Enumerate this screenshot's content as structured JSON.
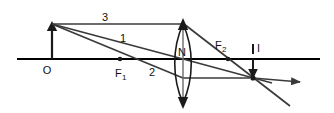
{
  "diagram": {
    "colors": {
      "background": "#ffffff",
      "ink": "#1a1a1a",
      "ray": "#3a3a3a",
      "axis": "#000000"
    },
    "labels": {
      "object": "O",
      "focal_near": "F",
      "focal_near_sub": "1",
      "focal_far": "F",
      "focal_far_sub": "2",
      "lens_center": "N",
      "image": "I",
      "ray_one": "1",
      "ray_two": "2",
      "ray_three": "3"
    },
    "geometry": {
      "axis_y": 59,
      "axis_x_start": 17,
      "axis_x_end": 320,
      "object_x": 52,
      "object_top_y": 24,
      "lens_x": 183,
      "lens_top_y": 22,
      "lens_bottom_y": 105,
      "focal_near_x": 120,
      "focal_far_x": 228,
      "image_x": 253,
      "image_bottom_y": 78
    },
    "points": [
      {
        "name": "object-base",
        "x": 52,
        "y": 59
      },
      {
        "name": "object-tip",
        "x": 52,
        "y": 24
      },
      {
        "name": "focal-point-1",
        "x": 120,
        "y": 59
      },
      {
        "name": "lens-center-N",
        "x": 183,
        "y": 59
      },
      {
        "name": "focal-point-2",
        "x": 228,
        "y": 59
      },
      {
        "name": "image-point",
        "x": 253,
        "y": 78
      }
    ],
    "rays": [
      {
        "id": "3",
        "description": "parallel-to-axis-then-through-F2",
        "path": "52,24 183,24 253,78"
      },
      {
        "id": "1",
        "description": "through-optical-center-N-undeviated",
        "path": "52,24 183,59 290,102"
      },
      {
        "id": "2",
        "description": "through-F1-then-parallel-to-axis",
        "path": "52,24 183,78 253,78"
      }
    ]
  }
}
